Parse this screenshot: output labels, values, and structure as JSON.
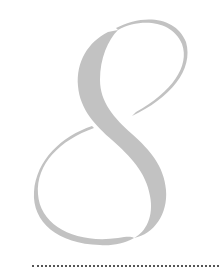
{
  "ornament": {
    "numeral": "8",
    "fill_color": "#c2c2c2",
    "style": "calligraphic decorative numeral"
  },
  "rule": {
    "style": "dotted",
    "color": "#555555"
  }
}
